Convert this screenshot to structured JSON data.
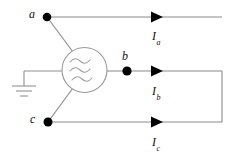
{
  "diagram": {
    "colors": {
      "wire": "#8a8a8a",
      "node": "#000000",
      "arrow": "#000000",
      "text": "#111111",
      "background": "#ffffff"
    },
    "source": {
      "symbol_name": "ac-source",
      "waveform": "three-wavy-lines"
    },
    "ground": {
      "symbol_name": "earth-ground",
      "bars": 3
    },
    "nodes": [
      {
        "id": "a",
        "label": "a",
        "x": 47,
        "y": 17
      },
      {
        "id": "b",
        "label": "b",
        "x": 127,
        "y": 71
      },
      {
        "id": "c",
        "label": "c",
        "x": 48,
        "y": 122
      }
    ],
    "currents": [
      {
        "id": "Ia",
        "symbol": "I",
        "subscript": "a",
        "x": 153,
        "y": 31
      },
      {
        "id": "Ib",
        "symbol": "I",
        "subscript": "b",
        "x": 153,
        "y": 86
      },
      {
        "id": "Ic",
        "symbol": "I",
        "subscript": "c",
        "x": 153,
        "y": 137
      }
    ],
    "arrows": [
      {
        "for": "Ia",
        "x": 151,
        "y": 17
      },
      {
        "for": "Ib",
        "x": 151,
        "y": 71
      },
      {
        "for": "Ic",
        "x": 151,
        "y": 122
      }
    ]
  }
}
